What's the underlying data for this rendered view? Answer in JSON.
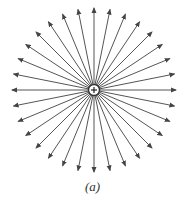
{
  "figure": {
    "caption": "(a)",
    "charge": {
      "sign": "+",
      "symbol": "plus-icon",
      "cx": 94,
      "cy": 90,
      "r": 5
    },
    "field_lines": {
      "count": 32,
      "direction": "outward",
      "length": 82,
      "inner_radius": 5
    },
    "colors": {
      "line": "#555555",
      "arrow": "#444444",
      "charge_stroke": "#333333",
      "charge_fill": "#ffffff"
    }
  }
}
